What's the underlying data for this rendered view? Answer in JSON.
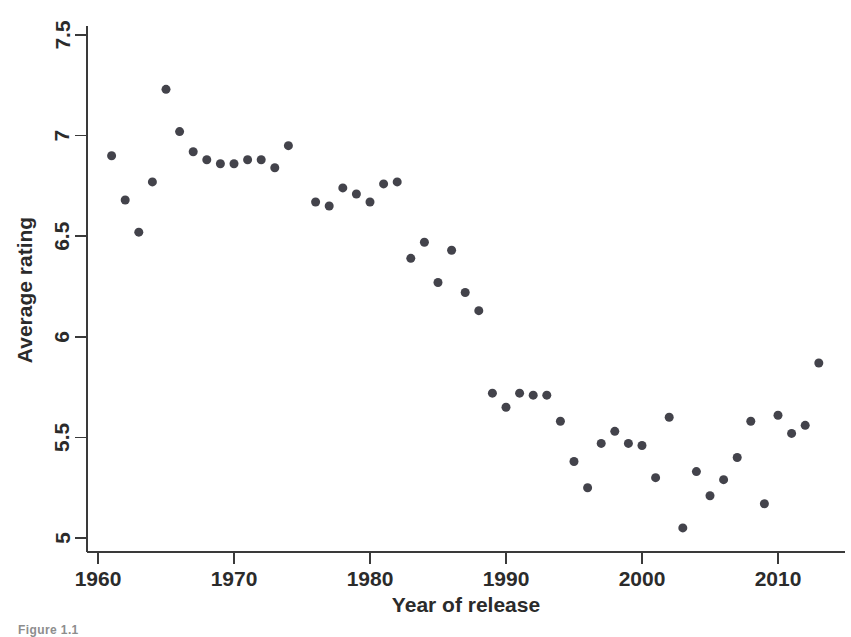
{
  "figure": {
    "background_color": "#ffffff",
    "marker_color": "#43434b",
    "axis_color": "#3a3a3a",
    "caption_partial": "Figure 1.1"
  },
  "chart_data": {
    "type": "scatter",
    "title": "",
    "xlabel": "Year of release",
    "ylabel": "Average rating",
    "xlim": [
      1959.0,
      2014.5
    ],
    "ylim": [
      4.93,
      7.57
    ],
    "xticks": [
      1960,
      1970,
      1980,
      1990,
      2000,
      2010
    ],
    "xtick_labels": [
      "1960",
      "1970",
      "1980",
      "1990",
      "2000",
      "2010"
    ],
    "yticks": [
      5,
      5.5,
      6,
      6.5,
      7,
      7.5
    ],
    "ytick_labels": [
      "5",
      "5.5",
      "6",
      "6.5",
      "7",
      "7.5"
    ],
    "grid": false,
    "legend": null,
    "marker_shape": "circle",
    "marker_size_px": 9,
    "x": [
      1961,
      1962,
      1963,
      1964,
      1965,
      1966,
      1967,
      1968,
      1969,
      1970,
      1971,
      1972,
      1973,
      1974,
      1976,
      1977,
      1978,
      1979,
      1980,
      1981,
      1982,
      1983,
      1984,
      1985,
      1986,
      1987,
      1989,
      1990,
      1991,
      1992,
      1993,
      1995,
      1996,
      1997,
      1998,
      1999,
      2000,
      2001,
      2002,
      2003,
      2004,
      2005,
      2006,
      2007,
      2008,
      2009,
      2010,
      2011,
      2012,
      2013
    ],
    "y": [
      6.9,
      6.68,
      6.52,
      6.77,
      7.23,
      7.02,
      6.92,
      6.88,
      6.86,
      6.86,
      6.88,
      6.88,
      6.84,
      6.95,
      6.67,
      6.65,
      6.74,
      6.71,
      6.67,
      6.76,
      6.77,
      6.39,
      6.47,
      6.27,
      6.43,
      6.22,
      6.13,
      5.72,
      5.65,
      5.72,
      5.71,
      5.58,
      5.38,
      5.25,
      5.47,
      5.52,
      5.53,
      5.46,
      5.48,
      5.3,
      5.6,
      5.05,
      5.33,
      5.21,
      5.29,
      5.4,
      5.58,
      5.17,
      5.61,
      5.52
    ],
    "points": [
      {
        "year": 1961,
        "rating": 6.9
      },
      {
        "year": 1962,
        "rating": 6.68
      },
      {
        "year": 1963,
        "rating": 6.52
      },
      {
        "year": 1964,
        "rating": 6.77
      },
      {
        "year": 1965,
        "rating": 7.23
      },
      {
        "year": 1966,
        "rating": 7.02
      },
      {
        "year": 1967,
        "rating": 6.92
      },
      {
        "year": 1968,
        "rating": 6.88
      },
      {
        "year": 1969,
        "rating": 6.86
      },
      {
        "year": 1970,
        "rating": 6.86
      },
      {
        "year": 1971,
        "rating": 6.88
      },
      {
        "year": 1972,
        "rating": 6.88
      },
      {
        "year": 1973,
        "rating": 6.84
      },
      {
        "year": 1974,
        "rating": 6.95
      },
      {
        "year": 1976,
        "rating": 6.67
      },
      {
        "year": 1977,
        "rating": 6.65
      },
      {
        "year": 1978,
        "rating": 6.74
      },
      {
        "year": 1979,
        "rating": 6.71
      },
      {
        "year": 1980,
        "rating": 6.67
      },
      {
        "year": 1981,
        "rating": 6.76
      },
      {
        "year": 1982,
        "rating": 6.77
      },
      {
        "year": 1983,
        "rating": 6.39
      },
      {
        "year": 1984,
        "rating": 6.47
      },
      {
        "year": 1985,
        "rating": 6.27
      },
      {
        "year": 1986,
        "rating": 6.43
      },
      {
        "year": 1987,
        "rating": 6.22
      },
      {
        "year": 1988,
        "rating": 6.13
      },
      {
        "year": 1989,
        "rating": 5.72
      },
      {
        "year": 1990,
        "rating": 5.65
      },
      {
        "year": 1991,
        "rating": 5.72
      },
      {
        "year": 1992,
        "rating": 5.71
      },
      {
        "year": 1993,
        "rating": 5.71
      },
      {
        "year": 1994,
        "rating": 5.58
      },
      {
        "year": 1995,
        "rating": 5.38
      },
      {
        "year": 1996,
        "rating": 5.25
      },
      {
        "year": 1997,
        "rating": 5.47
      },
      {
        "year": 1998,
        "rating": 5.53
      },
      {
        "year": 1999,
        "rating": 5.47
      },
      {
        "year": 2000,
        "rating": 5.46
      },
      {
        "year": 2001,
        "rating": 5.3
      },
      {
        "year": 2002,
        "rating": 5.6
      },
      {
        "year": 2003,
        "rating": 5.05
      },
      {
        "year": 2004,
        "rating": 5.33
      },
      {
        "year": 2005,
        "rating": 5.21
      },
      {
        "year": 2006,
        "rating": 5.29
      },
      {
        "year": 2007,
        "rating": 5.4
      },
      {
        "year": 2008,
        "rating": 5.58
      },
      {
        "year": 2009,
        "rating": 5.17
      },
      {
        "year": 2010,
        "rating": 5.61
      },
      {
        "year": 2011,
        "rating": 5.52
      },
      {
        "year": 2012,
        "rating": 5.56
      },
      {
        "year": 2013,
        "rating": 5.87
      }
    ]
  }
}
